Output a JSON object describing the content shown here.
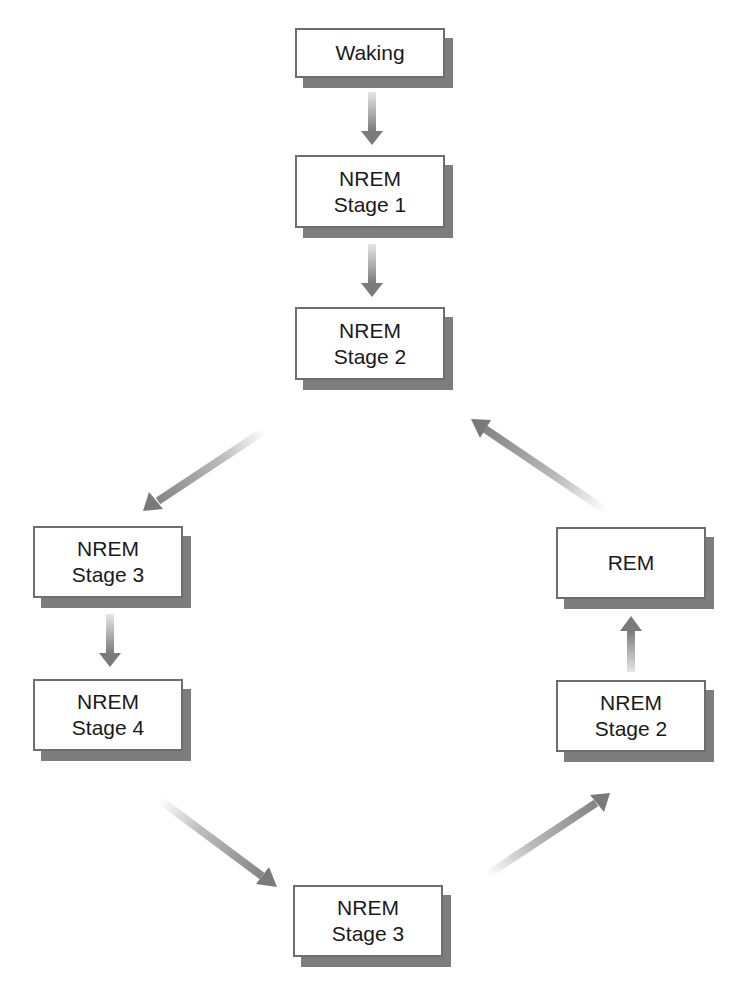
{
  "diagram": {
    "colors": {
      "box_border": "#6e6e6e",
      "box_shadow": "#7d7d7d",
      "arrow": "#808080",
      "text": "#1a1a1a"
    },
    "nodes": [
      {
        "id": "waking",
        "line1": "Waking",
        "line2": ""
      },
      {
        "id": "nrem1",
        "line1": "NREM",
        "line2": "Stage 1"
      },
      {
        "id": "nrem2_top",
        "line1": "NREM",
        "line2": "Stage 2"
      },
      {
        "id": "nrem3_left",
        "line1": "NREM",
        "line2": "Stage 3"
      },
      {
        "id": "nrem4",
        "line1": "NREM",
        "line2": "Stage 4"
      },
      {
        "id": "nrem3_bottom",
        "line1": "NREM",
        "line2": "Stage 3"
      },
      {
        "id": "nrem2_right",
        "line1": "NREM",
        "line2": "Stage 2"
      },
      {
        "id": "rem",
        "line1": "REM",
        "line2": ""
      }
    ],
    "edges": [
      {
        "from": "waking",
        "to": "nrem1"
      },
      {
        "from": "nrem1",
        "to": "nrem2_top"
      },
      {
        "from": "nrem2_top",
        "to": "nrem3_left"
      },
      {
        "from": "nrem3_left",
        "to": "nrem4"
      },
      {
        "from": "nrem4",
        "to": "nrem3_bottom"
      },
      {
        "from": "nrem3_bottom",
        "to": "nrem2_right"
      },
      {
        "from": "nrem2_right",
        "to": "rem"
      },
      {
        "from": "rem",
        "to": "nrem2_top"
      }
    ]
  }
}
